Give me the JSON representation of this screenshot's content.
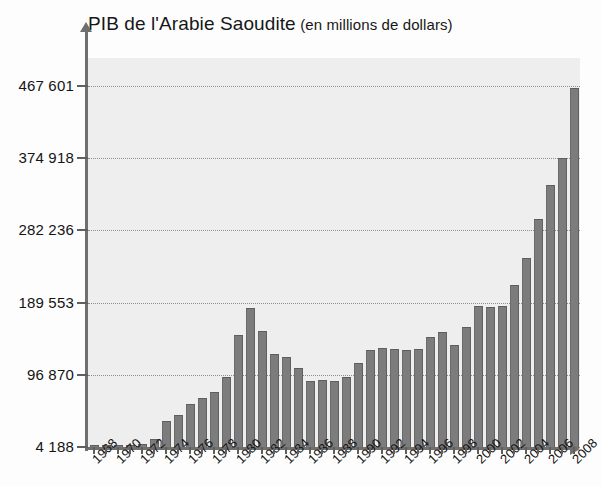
{
  "chart_data": {
    "type": "bar",
    "title": "PIB de l'Arabie Saoudite",
    "subtitle": "(en millions de dollars)",
    "title_full": "PIB de l'Arabie Saoudite (en millions de dollars)",
    "xlabel": "",
    "ylabel": "",
    "ylim": [
      4188,
      467601
    ],
    "grid": true,
    "legend": null,
    "yticks": [
      4188,
      96870,
      189553,
      282236,
      374918,
      467601
    ],
    "ytick_labels": [
      "4 188",
      "96 870",
      "189 553",
      "282 236",
      "374 918",
      "467 601"
    ],
    "xtick_labels": [
      "1968",
      "1970",
      "1972",
      "1974",
      "1976",
      "1978",
      "1980",
      "1982",
      "1984",
      "1986",
      "1988",
      "1990",
      "1992",
      "1994",
      "1996",
      "1998",
      "2000",
      "2002",
      "2004",
      "2006",
      "2008"
    ],
    "categories": [
      "1968",
      "1969",
      "1970",
      "1971",
      "1972",
      "1973",
      "1974",
      "1975",
      "1976",
      "1977",
      "1978",
      "1979",
      "1980",
      "1981",
      "1982",
      "1983",
      "1984",
      "1985",
      "1986",
      "1987",
      "1988",
      "1989",
      "1990",
      "1991",
      "1992",
      "1993",
      "1994",
      "1995",
      "1996",
      "1997",
      "1998",
      "1999",
      "2000",
      "2001",
      "2002",
      "2003",
      "2004",
      "2005",
      "2006",
      "2007",
      "2008"
    ],
    "values": [
      4188,
      5400,
      6500,
      8200,
      10500,
      17000,
      40000,
      48000,
      62000,
      70000,
      78000,
      96000,
      150000,
      185000,
      156000,
      126000,
      122000,
      108000,
      92000,
      93000,
      92000,
      97000,
      115000,
      131000,
      134000,
      132000,
      131000,
      133000,
      148000,
      155000,
      138000,
      161000,
      188000,
      186000,
      188000,
      215000,
      250000,
      300000,
      343000,
      378000,
      467601
    ],
    "value_unit": "millions de dollars",
    "bar_color": "#7c7c7c",
    "plot_background": "#eeeeee",
    "axis_color": "#6f6f6f",
    "grid_color": "#8d8d8d"
  }
}
